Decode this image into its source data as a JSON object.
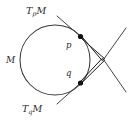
{
  "figure": {
    "background_color": "#ffffff",
    "width": 130,
    "height": 120,
    "stroke_color": "#3a3a3a",
    "accent_color": "#111111"
  },
  "labels": {
    "tangent_p": {
      "base": "T",
      "sub": "p",
      "tail": "M",
      "full": "TpM"
    },
    "tangent_q": {
      "base": "T",
      "sub": "q",
      "tail": "M",
      "full": "TqM"
    },
    "manifold": "M",
    "point_p": "p",
    "point_q": "q"
  },
  "geometry": {
    "circle": {
      "cx": 55,
      "cy": 60,
      "r": 35
    },
    "point_p": {
      "x": 80.5,
      "y": 36.5
    },
    "point_q": {
      "x": 80.5,
      "y": 83.0
    },
    "intersection": {
      "x": 103.5,
      "y": 59.5
    },
    "tangent_p_line": {
      "x1": 57.0,
      "y1": 16.0,
      "x2": 126.0,
      "y2": 92.0
    },
    "tangent_q_line": {
      "x1": 57.0,
      "y1": 104.0,
      "x2": 126.0,
      "y2": 28.0
    },
    "label_positions": {
      "tangent_p": {
        "x": 26,
        "y": 14
      },
      "tangent_q": {
        "x": 22,
        "y": 112
      },
      "manifold": {
        "x": 6,
        "y": 63
      },
      "point_p": {
        "x": 66,
        "y": 48
      },
      "point_q": {
        "x": 66,
        "y": 76
      }
    }
  }
}
